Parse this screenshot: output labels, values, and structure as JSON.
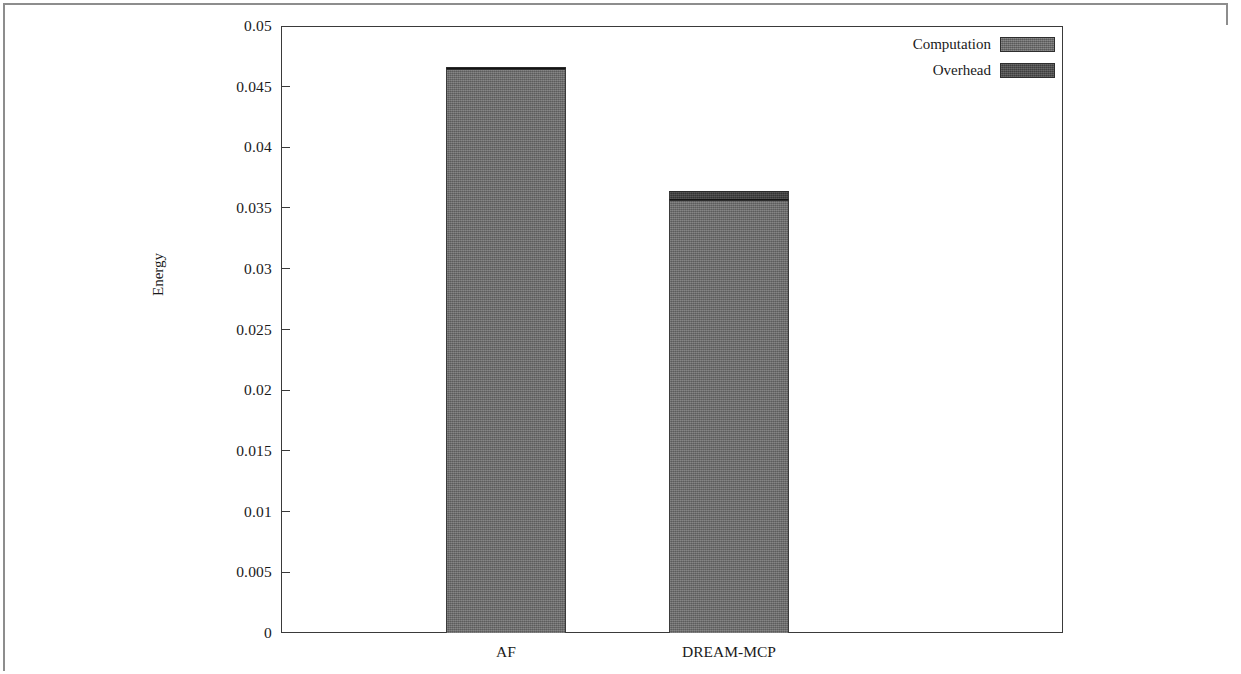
{
  "chart_data": {
    "type": "bar",
    "title": "",
    "subtitle": "",
    "xlabel": "",
    "ylabel": "Energy",
    "categories": [
      "AF",
      "DREAM-MCP"
    ],
    "series": [
      {
        "name": "Computation",
        "values": [
          0.04645,
          0.03565
        ],
        "color": "#6e6e6e"
      },
      {
        "name": "Overhead",
        "values": [
          0.00015,
          0.00075
        ],
        "color": "#3b3b3b"
      }
    ],
    "totals": [
      0.0466,
      0.0364
    ],
    "stacked": true,
    "ylim": [
      0,
      0.05
    ],
    "ytick_values": [
      0,
      0.005,
      0.01,
      0.015,
      0.02,
      0.025,
      0.03,
      0.035,
      0.04,
      0.045,
      0.05
    ],
    "ytick_labels": [
      "0",
      "0.005",
      "0.01",
      "0.015",
      "0.02",
      "0.025",
      "0.03",
      "0.035",
      "0.04",
      "0.045",
      "0.05"
    ],
    "grid": false,
    "legend_position": "top-right",
    "legend_entries": [
      "Computation",
      "Overhead"
    ]
  },
  "axes": {
    "y_title": "Energy"
  },
  "legend": {
    "rows": [
      {
        "label": "Computation",
        "swatch": "computation-swatch"
      },
      {
        "label": "Overhead",
        "swatch": "overhead-swatch"
      }
    ]
  }
}
